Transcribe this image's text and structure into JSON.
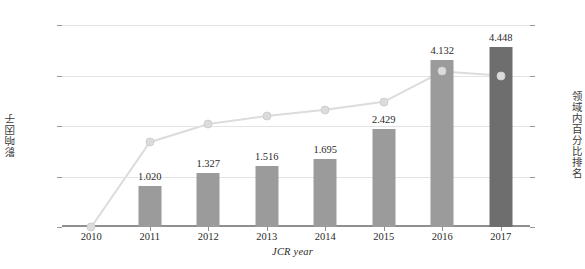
{
  "chart_data": {
    "type": "bar",
    "title": "",
    "xlabel": "JCR year",
    "ylabel": "影响因子",
    "y2label": "领域内百分比排名",
    "categories": [
      "2010",
      "2011",
      "2012",
      "2013",
      "2014",
      "2015",
      "2016",
      "2017"
    ],
    "ylim": [
      0,
      5
    ],
    "y2lim": [
      0,
      100
    ],
    "grid": true,
    "legend": "none",
    "yticks": [
      "0.000",
      "1.250",
      "2.500",
      "3.750",
      "5.000"
    ],
    "ytick_values": [
      0,
      1.25,
      2.5,
      3.75,
      5
    ],
    "y2ticks": [
      "0%",
      "25%",
      "50%",
      "75%",
      "100%"
    ],
    "y2tick_values": [
      0,
      25,
      50,
      75,
      100
    ],
    "series": [
      {
        "name": "影响因子",
        "type": "bar",
        "axis": "left",
        "values": [
          null,
          1.02,
          1.327,
          1.516,
          1.695,
          2.429,
          4.132,
          4.448
        ],
        "labels": [
          "",
          "1.020",
          "1.327",
          "1.516",
          "1.695",
          "2.429",
          "4.132",
          "4.448"
        ],
        "color": "#9b9b9b",
        "highlight_color": "#6e6e6e",
        "highlight_index": 7
      },
      {
        "name": "领域内百分比排名",
        "type": "line",
        "axis": "right",
        "values": [
          0,
          42,
          51,
          55,
          58,
          62,
          77,
          75
        ],
        "color": "#dcdcdc",
        "marker": "circle"
      }
    ],
    "colors": {
      "bar": "#9b9b9b",
      "bar_highlight": "#6e6e6e",
      "line": "#dcdcdc",
      "grid": "#e3e3e3",
      "axis": "#8f8f8f",
      "text": "#2b2b2b"
    }
  }
}
